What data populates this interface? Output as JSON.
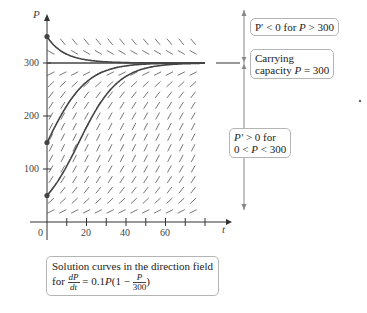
{
  "chart_data": {
    "type": "line",
    "xlabel": "t",
    "ylabel": "P",
    "xlim": [
      0,
      80
    ],
    "ylim": [
      0,
      360
    ],
    "x_ticks": [
      0,
      10,
      20,
      30,
      40,
      50,
      60,
      70,
      80
    ],
    "x_tick_labels": [
      "0",
      "20",
      "40",
      "60"
    ],
    "y_tick_labels": [
      "100",
      "200",
      "300"
    ],
    "grid": false,
    "direction_field": true,
    "equilibrium": {
      "P": 300,
      "label": "Carrying capacity P = 300"
    },
    "series": [
      {
        "name": "P(0)=350",
        "initial_value": 350,
        "behavior": "decreases to 300"
      },
      {
        "name": "P(0)=300",
        "initial_value": 300,
        "behavior": "constant"
      },
      {
        "name": "P(0)=150",
        "initial_value": 150,
        "behavior": "increases to 300"
      },
      {
        "name": "P(0)=50",
        "initial_value": 50,
        "behavior": "increases to 300"
      }
    ],
    "annotations": [
      "P' < 0 for P > 300",
      "Carrying capacity P = 300",
      "P' > 0 for 0 < P < 300"
    ]
  },
  "axes": {
    "y_label": "P",
    "x_label": "t",
    "origin_label": "0",
    "y_ticks": [
      {
        "v": 100,
        "label": "100"
      },
      {
        "v": 200,
        "label": "200"
      },
      {
        "v": 300,
        "label": "300"
      }
    ],
    "x_ticks": [
      {
        "v": 20,
        "label": "20"
      },
      {
        "v": 40,
        "label": "40"
      },
      {
        "v": 60,
        "label": "60"
      }
    ]
  },
  "annotations": {
    "above": {
      "lhs": "P′ < 0 for ",
      "var": "P",
      "rhs": " > 300"
    },
    "capacity": {
      "line1": "Carrying",
      "line2_pre": "capacity ",
      "var": "P",
      "line2_post": " = 300"
    },
    "below": {
      "line1_var": "P′",
      "line1_post": " > 0 for",
      "line2_pre": "0 < ",
      "var": "P",
      "line2_post": " < 300"
    }
  },
  "caption": {
    "line1": "Solution curves in the direction field",
    "for": "for",
    "num": "dP",
    "den": "dt",
    "eq": " = 0.1",
    "var": "P",
    "paren_open": "(1 − ",
    "inner_num": "P",
    "inner_den": "300",
    "paren_close": ")"
  },
  "colors": {
    "curve": "#444444",
    "field": "#777777",
    "axis": "#333333",
    "annotation_line": "#888888"
  }
}
